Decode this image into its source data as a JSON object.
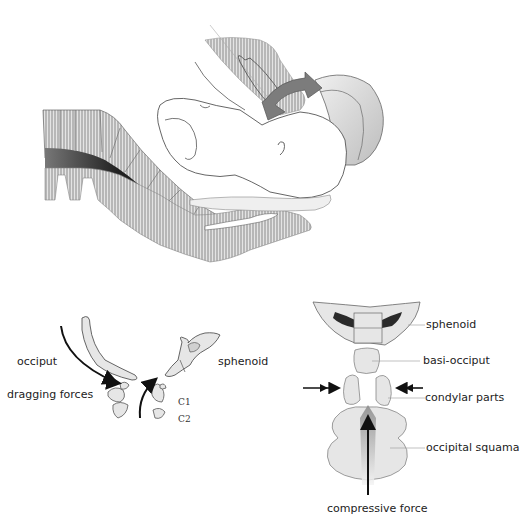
{
  "figure": {
    "panel_top": {
      "description": "Sagittal section: fetal head during birth with rotation arrow, maternal spine and pelvic tissues"
    },
    "panel_bottom_left": {
      "labels": {
        "occiput": "occiput",
        "dragging_forces": "dragging forces",
        "sphenoid": "sphenoid",
        "c1": "C1",
        "c2": "C2"
      }
    },
    "panel_bottom_right": {
      "labels": {
        "sphenoid": "sphenoid",
        "basi_occiput": "basi-occiput",
        "condylar_parts": "condylar parts",
        "occipital_squama": "occipital squama",
        "compressive_force": "compressive force"
      }
    },
    "colors": {
      "bone_fill": "#e6e6e6",
      "outline": "#555555",
      "hatch": "#9a9a9a",
      "arrow": "#111111",
      "rotation_arrow": "#777777",
      "dark_fill": "#2a2a2a"
    }
  }
}
